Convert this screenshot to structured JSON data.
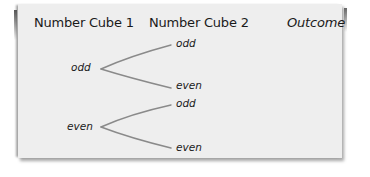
{
  "diagram": {
    "type": "tree-diagram",
    "headers": {
      "cube1": "Number Cube 1",
      "cube2": "Number Cube 2",
      "outcome": "Outcome"
    },
    "tree": [
      {
        "label": "odd",
        "children": [
          {
            "label": "odd",
            "outcome": ""
          },
          {
            "label": "even",
            "outcome": ""
          }
        ]
      },
      {
        "label": "even",
        "children": [
          {
            "label": "odd",
            "outcome": ""
          },
          {
            "label": "even",
            "outcome": ""
          }
        ]
      }
    ],
    "colors": {
      "paper": "#eeeeee",
      "text": "#1a1a1a",
      "branch": "#8a8a8a",
      "shadow": "#555555"
    }
  }
}
